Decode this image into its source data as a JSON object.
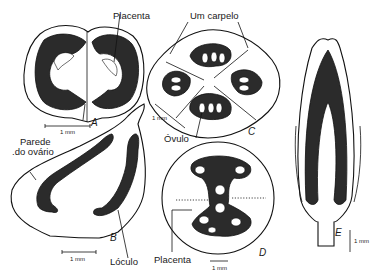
{
  "figure": {
    "panels": [
      {
        "id": "A",
        "letter": "A",
        "description": "Cross-section of bilocular ovary with axile placentation",
        "scale": "1 mm"
      },
      {
        "id": "B",
        "letter": "B",
        "description": "Longitudinal section of ovary showing ovary wall and locules",
        "scale": "1 mm"
      },
      {
        "id": "C",
        "letter": "C",
        "description": "Cross-section of four-carpellate ovary",
        "scale": "1 mm"
      },
      {
        "id": "D",
        "letter": "D",
        "description": "Cross-section with central placenta",
        "scale": "1 mm"
      },
      {
        "id": "E",
        "letter": "E",
        "description": "Longitudinal section of elongated ovary",
        "scale": "1 mm"
      }
    ],
    "labels": {
      "placenta_a": "Placenta",
      "um_carpelo": "Um carpelo",
      "parede_line1": "Parede",
      "parede_line2": ".do ovário",
      "ovulo": "Óvulo",
      "loculo": "Lóculo",
      "placenta_d": "Placenta"
    },
    "colors": {
      "ink": "#111111",
      "tissue": "#2b2b2b",
      "background": "#ffffff"
    }
  }
}
